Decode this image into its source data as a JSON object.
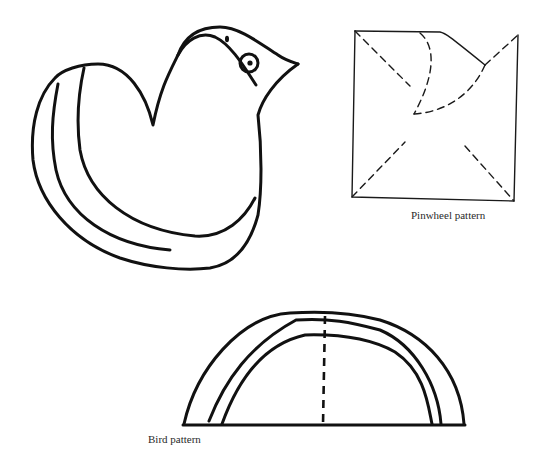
{
  "figures": {
    "bird": {
      "name": "Bird drawing"
    },
    "pinwheel": {
      "caption": "Pinwheel pattern"
    },
    "bird_pattern": {
      "caption": "Bird pattern"
    }
  },
  "colors": {
    "ink": "#111111",
    "background": "#ffffff"
  }
}
